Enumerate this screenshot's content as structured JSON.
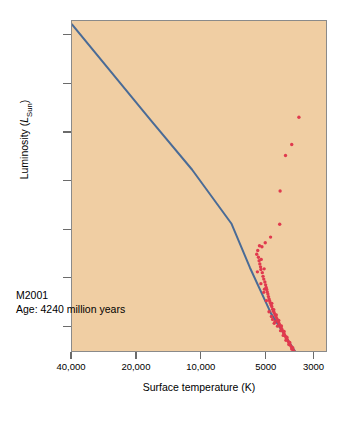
{
  "figure": {
    "background_color": "#ffffff",
    "plot_background_color": "#f0cea3",
    "frame_color": "#8a8a8a"
  },
  "annotation": {
    "cluster_name": "M2001",
    "age_line": "Age: 4240 million years"
  },
  "chart_data": {
    "type": "scatter",
    "title": "",
    "subtitle": "",
    "xlabel": "Surface temperature (K)",
    "ylabel": "Luminosity (LSun)",
    "ylabel_prefix": "Luminosity (",
    "ylabel_symbol": "L",
    "ylabel_subscript": "Sun",
    "ylabel_suffix": ")",
    "grid": false,
    "legend": "none",
    "x_scale": "log-reversed",
    "y_scale": "log",
    "xlim": [
      40000,
      2600
    ],
    "ylim": [
      0.03,
      200000
    ],
    "xticks": [
      40000,
      20000,
      10000,
      5000,
      3000
    ],
    "xtick_labels": [
      "40,000",
      "20,000",
      "10,000",
      "5000",
      "3000"
    ],
    "yticks": [
      100000,
      10000,
      1000,
      100,
      10,
      1,
      0.1
    ],
    "ytick_labels": [
      "100,000",
      "10,000",
      "1000",
      "100",
      "10",
      "1",
      "1/10"
    ],
    "annotations": [
      "M2001",
      "Age: 4240 million years"
    ],
    "series": [
      {
        "name": "Main sequence (zero-age) line",
        "type": "line",
        "color": "#4a6b96",
        "linewidth": 2.0,
        "points": [
          [
            40000,
            170000
          ],
          [
            17000,
            1700
          ],
          [
            11000,
            170
          ],
          [
            7200,
            13
          ],
          [
            5900,
            1.6
          ],
          [
            4700,
            0.18
          ],
          [
            3600,
            0.028
          ]
        ]
      },
      {
        "name": "Cluster stars",
        "type": "scatter",
        "color": "#e03a4e",
        "marker_size": 3.4,
        "points": [
          [
            3480,
            2050
          ],
          [
            3760,
            560
          ],
          [
            4020,
            330
          ],
          [
            4260,
            61
          ],
          [
            4280,
            12.5
          ],
          [
            4720,
            6.8
          ],
          [
            5000,
            5.2
          ],
          [
            5180,
            4.3
          ],
          [
            5320,
            4.5
          ],
          [
            5420,
            3.6
          ],
          [
            5480,
            3.0
          ],
          [
            5380,
            2.6
          ],
          [
            5340,
            2.2
          ],
          [
            5300,
            1.9
          ],
          [
            5260,
            1.65
          ],
          [
            5240,
            1.45
          ],
          [
            5220,
            2.35
          ],
          [
            5160,
            1.25
          ],
          [
            5120,
            1.05
          ],
          [
            5080,
            0.92
          ],
          [
            5060,
            1.5
          ],
          [
            5020,
            0.8
          ],
          [
            4980,
            0.7
          ],
          [
            4950,
            0.62
          ],
          [
            4920,
            0.56
          ],
          [
            4890,
            0.5
          ],
          [
            4860,
            0.45
          ],
          [
            4830,
            0.4
          ],
          [
            4800,
            0.36
          ],
          [
            4770,
            0.33
          ],
          [
            4740,
            0.3
          ],
          [
            4700,
            0.27
          ],
          [
            4660,
            0.25
          ],
          [
            4620,
            0.22
          ],
          [
            4580,
            0.2
          ],
          [
            4540,
            0.185
          ],
          [
            4500,
            0.17
          ],
          [
            4460,
            0.155
          ],
          [
            4420,
            0.142
          ],
          [
            4380,
            0.13
          ],
          [
            4340,
            0.12
          ],
          [
            4300,
            0.11
          ],
          [
            4260,
            0.1
          ],
          [
            4220,
            0.092
          ],
          [
            4180,
            0.085
          ],
          [
            4140,
            0.078
          ],
          [
            4100,
            0.071
          ],
          [
            4060,
            0.065
          ],
          [
            4020,
            0.06
          ],
          [
            3980,
            0.055
          ],
          [
            3940,
            0.051
          ],
          [
            3900,
            0.047
          ],
          [
            3860,
            0.043
          ],
          [
            3820,
            0.04
          ],
          [
            3780,
            0.037
          ],
          [
            3740,
            0.034
          ],
          [
            3700,
            0.031
          ],
          [
            3660,
            0.029
          ],
          [
            4620,
            0.135
          ],
          [
            4500,
            0.121
          ],
          [
            4380,
            0.098
          ],
          [
            4240,
            0.079
          ],
          [
            4120,
            0.063
          ],
          [
            4000,
            0.05
          ],
          [
            3880,
            0.041
          ],
          [
            3760,
            0.033
          ],
          [
            4660,
            0.29
          ],
          [
            4560,
            0.215
          ],
          [
            4440,
            0.168
          ],
          [
            4320,
            0.128
          ],
          [
            4200,
            0.099
          ],
          [
            4080,
            0.076
          ],
          [
            3960,
            0.058
          ],
          [
            3840,
            0.045
          ],
          [
            3720,
            0.035
          ],
          [
            5080,
            0.49
          ],
          [
            5440,
            1.3
          ],
          [
            5240,
            0.74
          ],
          [
            5040,
            0.57
          ],
          [
            4940,
            0.33
          ],
          [
            4800,
            0.195
          ],
          [
            4680,
            0.155
          ],
          [
            4540,
            0.112
          ]
        ]
      }
    ]
  }
}
